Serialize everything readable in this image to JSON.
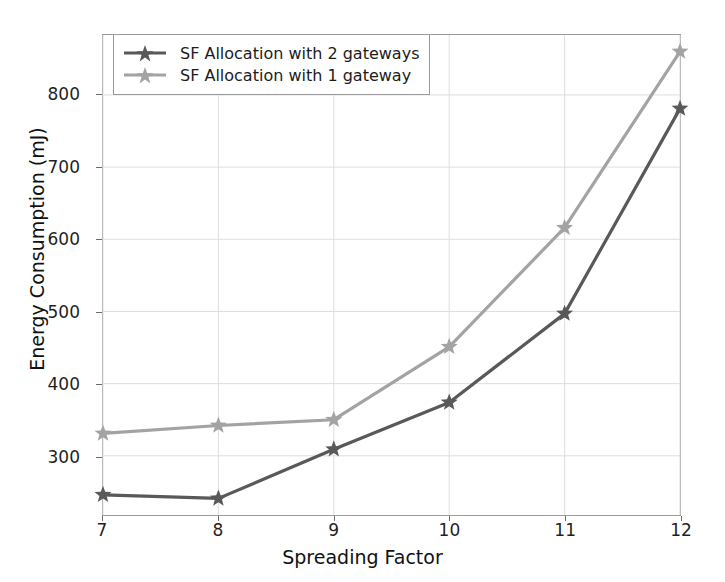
{
  "chart_data": {
    "type": "line",
    "title": "",
    "xlabel": "Spreading Factor",
    "ylabel": "Energy Consumption (mJ)",
    "x": [
      7,
      8,
      9,
      10,
      11,
      12
    ],
    "xtick_labels": [
      "7",
      "8",
      "9",
      "10",
      "11",
      "12"
    ],
    "ytick_labels": [
      "300",
      "400",
      "500",
      "600",
      "700",
      "800"
    ],
    "yticks": [
      300,
      400,
      500,
      600,
      700,
      800
    ],
    "xlim": [
      7,
      12
    ],
    "ylim": [
      218,
      883
    ],
    "grid": true,
    "legend_position": "upper left",
    "marker": "star",
    "series": [
      {
        "name": "SF Allocation with 2 gateways",
        "color": "#595959",
        "values": [
          246,
          241,
          309,
          374,
          497,
          781
        ]
      },
      {
        "name": "SF Allocation with 1 gateway",
        "color": "#a3a3a3",
        "values": [
          331,
          342,
          350,
          451,
          616,
          860
        ]
      }
    ]
  },
  "legend": {
    "items": [
      {
        "label": "SF Allocation with 2 gateways"
      },
      {
        "label": "SF Allocation with 1 gateway"
      }
    ]
  },
  "colors": {
    "series_dark": "#595959",
    "series_light": "#a3a3a3",
    "axis": "#9a9a9a",
    "grid": "#dedede",
    "text": "#1f1f1f",
    "background": "#ffffff"
  }
}
